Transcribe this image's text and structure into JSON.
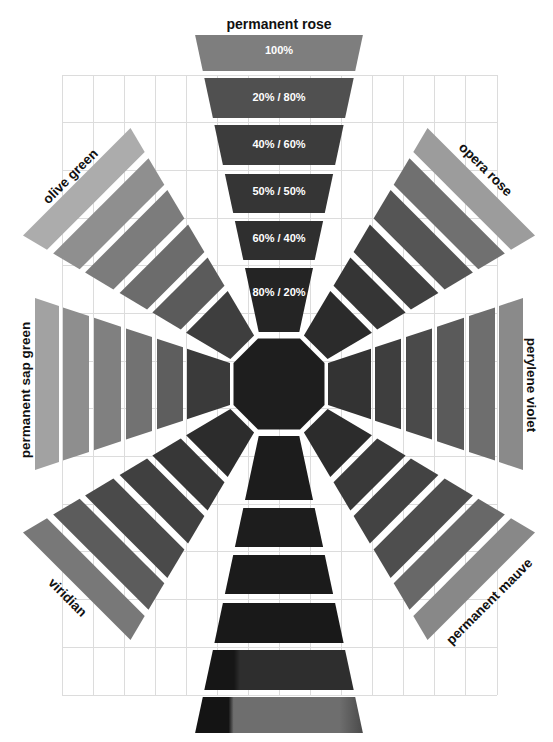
{
  "grid": {
    "line_color": "#dcdcdc"
  },
  "center": {
    "fill": "#1e1e1e"
  },
  "spokes": [
    {
      "position": "top",
      "label": "permanent rose",
      "tiles": [
        {
          "mix": "100%",
          "fill": "#7e7e7e"
        },
        {
          "mix": "20% / 80%",
          "fill": "#505050"
        },
        {
          "mix": "40% / 60%",
          "fill": "#3c3c3c"
        },
        {
          "mix": "50% / 50%",
          "fill": "#353535"
        },
        {
          "mix": "60% / 40%",
          "fill": "#2f2f2f"
        },
        {
          "mix": "80% / 20%",
          "fill": "#242424"
        }
      ]
    },
    {
      "position": "upper-right",
      "label": "opera rose",
      "tiles": [
        {
          "fill": "#9c9c9c"
        },
        {
          "fill": "#707070"
        },
        {
          "fill": "#555555"
        },
        {
          "fill": "#404040"
        },
        {
          "fill": "#353535"
        },
        {
          "fill": "#2b2b2b"
        }
      ]
    },
    {
      "position": "right",
      "label": "perylene violet",
      "tiles": [
        {
          "fill": "#8a8a8a"
        },
        {
          "fill": "#6e6e6e"
        },
        {
          "fill": "#5a5a5a"
        },
        {
          "fill": "#4a4a4a"
        },
        {
          "fill": "#3e3e3e"
        },
        {
          "fill": "#333333"
        }
      ]
    },
    {
      "position": "lower-right",
      "label": "permanent mauve",
      "tiles": [
        {
          "fill": "#888888"
        },
        {
          "fill": "#686868"
        },
        {
          "fill": "#4e4e4e"
        },
        {
          "fill": "#434343"
        },
        {
          "fill": "#393939"
        },
        {
          "fill": "#2c2c2c"
        }
      ]
    },
    {
      "position": "bottom",
      "tiles": [
        {
          "fill": "#6e6e6e",
          "dark_fill": "#141414",
          "speck_fill": "#4a4a4a"
        },
        {
          "fill": "#2e2e2e",
          "dark_fill": "#161616"
        },
        {
          "fill": "#191919"
        },
        {
          "fill": "#1b1b1b"
        },
        {
          "fill": "#1d1d1d"
        },
        {
          "fill": "#1c1c1c"
        }
      ]
    },
    {
      "position": "lower-left",
      "label": "viridian",
      "tiles": [
        {
          "fill": "#787878"
        },
        {
          "fill": "#5c5c5c"
        },
        {
          "fill": "#4a4a4a"
        },
        {
          "fill": "#404040"
        },
        {
          "fill": "#373737"
        },
        {
          "fill": "#2c2c2c"
        }
      ]
    },
    {
      "position": "left",
      "label": "permanent sap green",
      "tiles": [
        {
          "fill": "#a2a2a2"
        },
        {
          "fill": "#8e8e8e"
        },
        {
          "fill": "#808080"
        },
        {
          "fill": "#727272"
        },
        {
          "fill": "#5e5e5e"
        },
        {
          "fill": "#3a3a3a"
        }
      ]
    },
    {
      "position": "upper-left",
      "label": "olive green",
      "tiles": [
        {
          "fill": "#acacac"
        },
        {
          "fill": "#8f8f8f"
        },
        {
          "fill": "#7c7c7c"
        },
        {
          "fill": "#6c6c6c"
        },
        {
          "fill": "#5b5b5b"
        },
        {
          "fill": "#3e3e3e"
        }
      ]
    }
  ]
}
